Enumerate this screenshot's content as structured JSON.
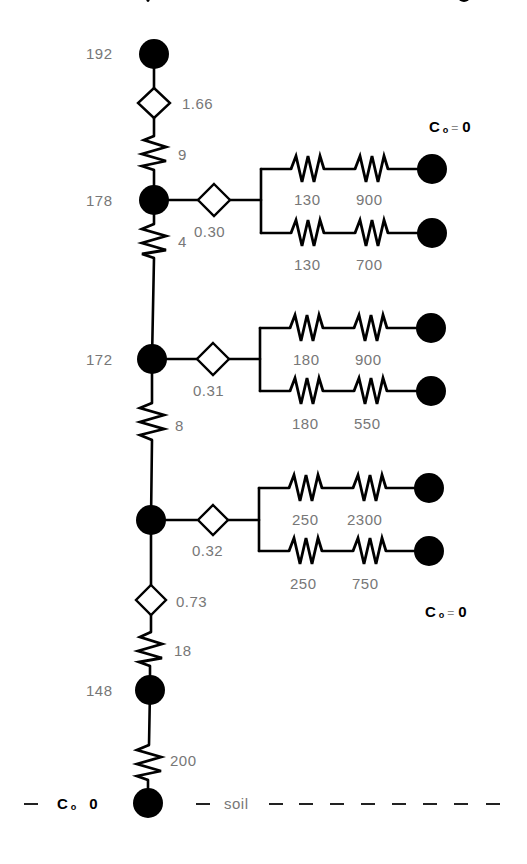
{
  "diagram": {
    "type": "resistance-network",
    "trunk_nodes": [
      {
        "id": "n_top",
        "label": "192"
      },
      {
        "id": "n_178",
        "label": "178"
      },
      {
        "id": "n_172",
        "label": "172"
      },
      {
        "id": "n_unlabeled",
        "label": ""
      },
      {
        "id": "n_148",
        "label": "148"
      },
      {
        "id": "n_soil",
        "label": ""
      }
    ],
    "trunk_elements": [
      {
        "type": "valve",
        "label": "1.66"
      },
      {
        "type": "resistor",
        "label": "9"
      },
      {
        "type": "resistor",
        "label": "4"
      },
      {
        "type": "resistor",
        "label": "8"
      },
      {
        "type": "valve",
        "label": "0.73"
      },
      {
        "type": "resistor",
        "label": "18"
      },
      {
        "type": "resistor",
        "label": "200"
      }
    ],
    "branches": [
      {
        "valve": "0.30",
        "upper": [
          "130",
          "900"
        ],
        "lower": [
          "130",
          "700"
        ]
      },
      {
        "valve": "0.31",
        "upper": [
          "180",
          "900"
        ],
        "lower": [
          "180",
          "550"
        ]
      },
      {
        "valve": "0.32",
        "upper": [
          "250",
          "2300"
        ],
        "lower": [
          "250",
          "750"
        ]
      }
    ],
    "boundary_labels": {
      "top_right": {
        "c": "C",
        "sub": "o",
        "eq": "=",
        "val": "0"
      },
      "bottom_right": {
        "c": "C",
        "sub": "o",
        "eq": "=",
        "val": "0"
      },
      "soil": {
        "c": "C",
        "sub": "o",
        "val": "0"
      },
      "soil_text": "soil"
    }
  }
}
